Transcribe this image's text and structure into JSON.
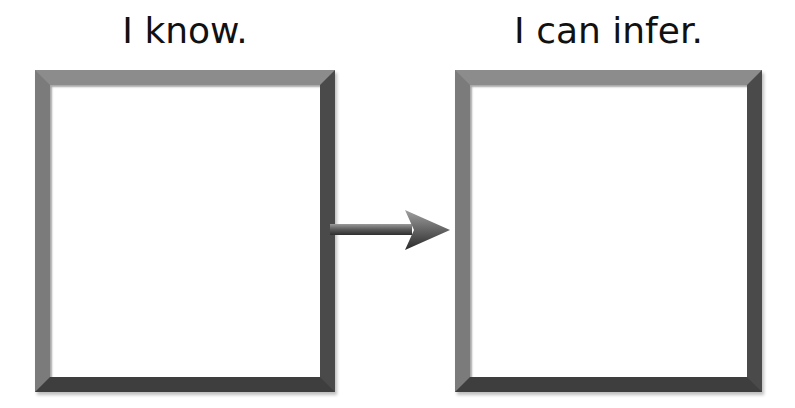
{
  "diagram": {
    "left": {
      "heading": "I know.",
      "content": ""
    },
    "right": {
      "heading": "I can infer.",
      "content": ""
    },
    "connector": {
      "type": "arrow",
      "direction": "right",
      "from": "left",
      "to": "right"
    }
  },
  "colors": {
    "frame": "#6a6a6a",
    "frame_dark": "#3e3e3e",
    "background": "#ffffff",
    "text": "#111111"
  }
}
